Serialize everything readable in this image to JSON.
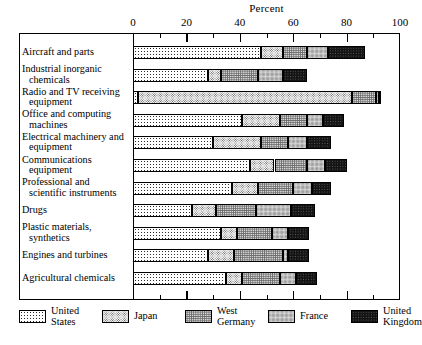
{
  "chart_data": {
    "type": "bar",
    "orientation": "horizontal",
    "stacked": true,
    "title": "",
    "xlabel": "Percent",
    "ylabel": "",
    "xlim": [
      0,
      100
    ],
    "xticks": [
      0,
      20,
      40,
      60,
      80,
      100
    ],
    "xminorticks": [
      10,
      30,
      50,
      70,
      90
    ],
    "grid": false,
    "legend_position": "bottom",
    "categories": [
      "Aircraft and parts",
      "Industrial inorganic chemicals",
      "Radio and TV receiving equipment",
      "Office and computing machines",
      "Electrical machinery and equipment",
      "Communications equipment",
      "Professional and scientific instruments",
      "Drugs",
      "Plastic materials, synthetics",
      "Engines and turbines",
      "Agricultural chemicals"
    ],
    "category_lines": [
      [
        "Aircraft and parts",
        ""
      ],
      [
        "Industrial inorganic",
        "chemicals"
      ],
      [
        "Radio and TV receiving",
        "equipment"
      ],
      [
        "Office and computing",
        "machines"
      ],
      [
        "Electrical machinery and",
        "equipment"
      ],
      [
        "Communications",
        "equipment"
      ],
      [
        "Professional and",
        "scientific instruments"
      ],
      [
        "Drugs",
        ""
      ],
      [
        "Plastic materials,",
        "synthetics"
      ],
      [
        "Engines and turbines",
        ""
      ],
      [
        "Agricultural chemicals",
        ""
      ]
    ],
    "series": [
      {
        "name": "United States",
        "pattern": "p-us",
        "values": [
          48,
          28,
          2,
          41,
          30,
          44,
          37,
          22,
          33,
          28,
          35
        ]
      },
      {
        "name": "Japan",
        "pattern": "p-jp",
        "values": [
          8,
          5,
          80,
          14,
          18,
          9,
          10,
          9,
          6,
          10,
          6
        ]
      },
      {
        "name": "West Germany",
        "pattern": "p-wg",
        "values": [
          9,
          14,
          9,
          10,
          10,
          12,
          13,
          15,
          13,
          18,
          14
        ]
      },
      {
        "name": "France",
        "pattern": "p-fr",
        "values": [
          8,
          9,
          1,
          6,
          7,
          7,
          7,
          13,
          6,
          2,
          6
        ]
      },
      {
        "name": "United Kingdom",
        "pattern": "p-uk",
        "values": [
          14,
          9,
          1,
          8,
          9,
          8,
          7,
          9,
          8,
          8,
          8
        ]
      }
    ],
    "totals": [
      87,
      65,
      93,
      79,
      74,
      80,
      74,
      68,
      66,
      66,
      69
    ]
  },
  "axis": {
    "title": "Percent",
    "tick_labels": [
      "0",
      "20",
      "40",
      "60",
      "80",
      "100"
    ]
  },
  "legend": {
    "items": [
      {
        "label_lines": [
          "United",
          "States"
        ],
        "name": "United States",
        "pattern": "p-us"
      },
      {
        "label_lines": [
          "Japan",
          ""
        ],
        "name": "Japan",
        "pattern": "p-jp"
      },
      {
        "label_lines": [
          "West",
          "Germany"
        ],
        "name": "West Germany",
        "pattern": "p-wg"
      },
      {
        "label_lines": [
          "France",
          ""
        ],
        "name": "France",
        "pattern": "p-fr"
      },
      {
        "label_lines": [
          "United",
          "Kingdom"
        ],
        "name": "United Kingdom",
        "pattern": "p-uk"
      }
    ]
  },
  "colors": {
    "ink": "#000000",
    "background": "#ffffff"
  }
}
